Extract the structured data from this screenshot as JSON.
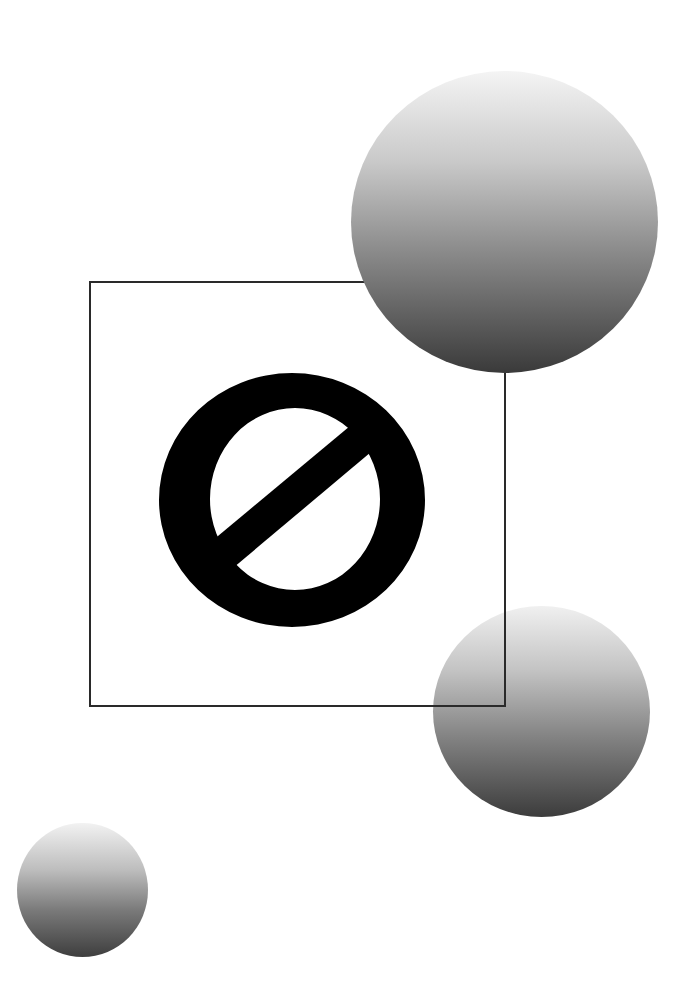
{
  "composition": {
    "background_color": "#ffffff",
    "frame": {
      "label": "square-frame",
      "stroke_color": "#2a2a2a"
    },
    "symbol": {
      "glyph": "Ø",
      "name": "empty-set",
      "color": "#000000"
    },
    "spheres": [
      {
        "name": "large-sphere",
        "gradient_top": "#f4f4f4",
        "gradient_bottom": "#3a3a3a"
      },
      {
        "name": "medium-sphere",
        "gradient_top": "#f0f0f0",
        "gradient_bottom": "#3c3c3c"
      },
      {
        "name": "small-sphere",
        "gradient_top": "#f2f2f2",
        "gradient_bottom": "#3e3e3e"
      }
    ]
  }
}
